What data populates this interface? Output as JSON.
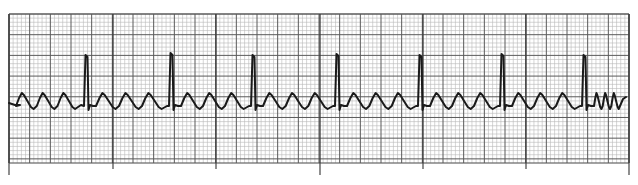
{
  "figure": {
    "kind": "ECG rhythm strip",
    "colors": {
      "background": "#ffffff",
      "grid_minor": "#b8b8b8",
      "grid_major": "#5a5a5a",
      "trace": "#1a1a1a"
    },
    "grid": {
      "left": 9,
      "top": 14,
      "right": 629,
      "bottom": 163,
      "minor_px": 4.13,
      "major_px": 20.65
    },
    "time_marks_x": [
      9,
      113,
      216,
      320,
      423,
      526,
      629
    ],
    "long_marks_x": [
      9,
      320,
      629
    ],
    "baseline_y": 104,
    "r_peaks": [
      {
        "x": 86,
        "y": 55
      },
      {
        "x": 171,
        "y": 53
      },
      {
        "x": 253,
        "y": 55
      },
      {
        "x": 337,
        "y": 54
      },
      {
        "x": 420,
        "y": 55
      },
      {
        "x": 502,
        "y": 54
      },
      {
        "x": 584,
        "y": 55
      }
    ]
  }
}
